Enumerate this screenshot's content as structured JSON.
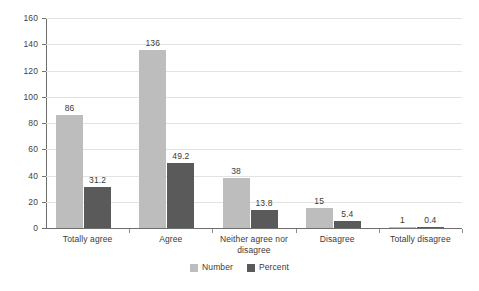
{
  "chart_data": {
    "type": "bar",
    "title": "",
    "subtitle": "",
    "xlabel": "",
    "ylabel": "",
    "ylim": [
      0,
      160
    ],
    "ytick_step": 20,
    "yticks": [
      "0",
      "20",
      "40",
      "60",
      "80",
      "100",
      "120",
      "140",
      "160"
    ],
    "grid": true,
    "legend_position": "bottom-center",
    "categories": [
      "Totally agree",
      "Agree",
      "Neither agree nor disagree",
      "Disagree",
      "Totally disagree"
    ],
    "category_lines": [
      [
        "Totally agree"
      ],
      [
        "Agree"
      ],
      [
        "Neither agree nor",
        "disagree"
      ],
      [
        "Disagree"
      ],
      [
        "Totally disagree"
      ]
    ],
    "series": [
      {
        "name": "Number",
        "color": "#bdbdbd",
        "values": [
          86,
          136,
          38,
          15,
          1
        ],
        "labels": [
          "86",
          "136",
          "38",
          "15",
          "1"
        ]
      },
      {
        "name": "Percent",
        "color": "#5a5a5a",
        "values": [
          31.2,
          49.2,
          13.8,
          5.4,
          0.4
        ],
        "labels": [
          "31.2",
          "49.2",
          "13.8",
          "5.4",
          "0.4"
        ]
      }
    ]
  },
  "legend": {
    "items": [
      {
        "label": "Number",
        "swatch": "#bdbdbd"
      },
      {
        "label": "Percent",
        "swatch": "#5a5a5a"
      }
    ]
  },
  "colors": {
    "background": "#ffffff",
    "gridline": "#e3e3e3",
    "axis": "#6e6e6e",
    "text": "#3a3a3a",
    "series_number": "#bdbdbd",
    "series_percent": "#5a5a5a"
  }
}
